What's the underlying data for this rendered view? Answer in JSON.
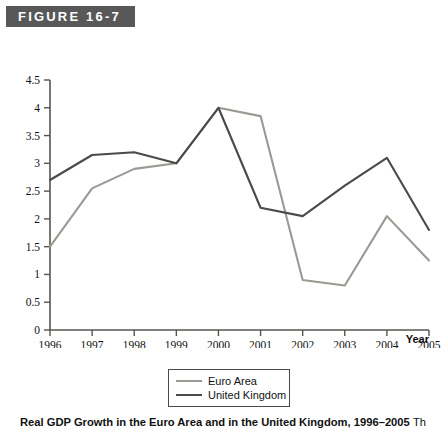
{
  "figure": {
    "banner_label": "FIGURE 16-7",
    "banner_color": "#585858",
    "caption": "Real GDP Growth in the Euro Area and in the United Kingdom, 1996–2005",
    "caption_tail": "Th"
  },
  "legend": {
    "position": "below-axis-center",
    "items": [
      {
        "label": "Euro Area",
        "color": "#9a9a94"
      },
      {
        "label": "United Kingdom",
        "color": "#4a4a4a"
      }
    ]
  },
  "chart_data": {
    "type": "line",
    "title": "Real GDP Growth in the Euro Area and in the United Kingdom, 1996–2005",
    "xlabel": "Year",
    "ylabel": "",
    "x": [
      1996,
      1997,
      1998,
      1999,
      2000,
      2001,
      2002,
      2003,
      2004,
      2005
    ],
    "categories": [
      "1996",
      "1997",
      "1998",
      "1999",
      "2000",
      "2001",
      "2002",
      "2003",
      "2004",
      "2005"
    ],
    "xlim": [
      1996,
      2005
    ],
    "ylim": [
      0,
      4.5
    ],
    "yticks": [
      "0",
      "0.5",
      "1",
      "1.5",
      "2",
      "2.5",
      "3",
      "3.5",
      "4",
      "4.5"
    ],
    "ytick_values": [
      0,
      0.5,
      1,
      1.5,
      2,
      2.5,
      3,
      3.5,
      4,
      4.5
    ],
    "grid": false,
    "series": [
      {
        "name": "Euro Area",
        "color": "#9a9a94",
        "values": [
          1.5,
          2.55,
          2.9,
          3.0,
          4.0,
          3.85,
          0.9,
          0.8,
          2.05,
          1.25
        ]
      },
      {
        "name": "United Kingdom",
        "color": "#4a4a4a",
        "values": [
          2.7,
          3.15,
          3.2,
          3.0,
          4.0,
          2.2,
          2.05,
          2.6,
          3.1,
          1.8
        ]
      }
    ]
  }
}
